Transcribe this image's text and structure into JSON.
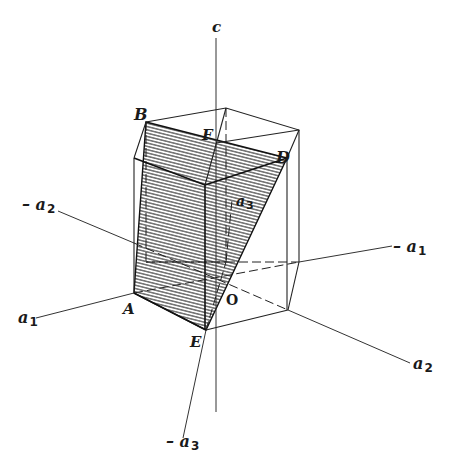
{
  "figure": {
    "type": "crystallographic-axes-diagram",
    "ink_color": "#1a1a1a",
    "background_color": "#ffffff"
  },
  "axes": {
    "c": "c",
    "minus_a2": "– a",
    "minus_a2_sub": "2",
    "a1": "a",
    "a1_sub": "1",
    "minus_a1": "– a",
    "minus_a1_sub": "1",
    "a2": "a",
    "a2_sub": "2",
    "a3": "a",
    "a3_sub": "3",
    "minus_a3": "– a",
    "minus_a3_sub": "3"
  },
  "points": {
    "A": "A",
    "B": "B",
    "D": "D",
    "E": "E",
    "F": "F",
    "O": "O"
  },
  "hatched_plane": [
    "B",
    "D",
    "E",
    "A"
  ]
}
